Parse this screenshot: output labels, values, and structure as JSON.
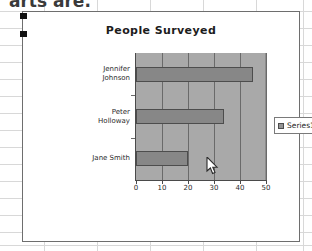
{
  "background": {
    "clipped_text": "arts are.",
    "grid_visible": true
  },
  "chart_object": {
    "selected": true,
    "handles": [
      "left-top",
      "left-middle"
    ],
    "border_color": "#6e6e6e",
    "background_color": "#ffffff"
  },
  "legend": {
    "position": "right",
    "entries": [
      {
        "label": "Series1",
        "color": "#949494"
      }
    ]
  },
  "cursor": {
    "type": "arrow-pointer",
    "x": 188,
    "y": 152
  },
  "chart_data": {
    "type": "bar",
    "orientation": "horizontal",
    "title": "People Surveyed",
    "xlabel": "",
    "ylabel": "",
    "categories": [
      "Jennifer Johnson",
      "Peter Holloway",
      "Jane Smith"
    ],
    "category_lines": [
      [
        "Jennifer",
        "Johnson"
      ],
      [
        "Peter",
        "Holloway"
      ],
      [
        "Jane Smith"
      ]
    ],
    "series": [
      {
        "name": "Series1",
        "values": [
          45,
          34,
          20
        ],
        "color": "#878787"
      }
    ],
    "values": [
      45,
      34,
      20
    ],
    "xlim": [
      0,
      50
    ],
    "xticks": [
      0,
      10,
      20,
      30,
      40,
      50
    ],
    "xtick_labels": [
      "0",
      "10",
      "20",
      "30",
      "40",
      "50"
    ],
    "grid": "vertical",
    "plot_background": "#a9a9a9",
    "legend_position": "right"
  }
}
